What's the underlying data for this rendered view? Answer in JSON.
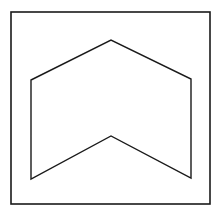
{
  "diagram": {
    "stroke_color": "#1a1a1a",
    "background": "#ffffff",
    "frame": {
      "x": 11,
      "y": 12,
      "width": 199,
      "height": 192,
      "stroke_width": 1.6
    },
    "chevron_shape": {
      "description": "Upward-pointing chevron (arrow-like hexagon)",
      "stroke_width": 1.4,
      "points": [
        [
          31,
          80
        ],
        [
          111,
          40
        ],
        [
          191,
          79
        ],
        [
          191,
          178
        ],
        [
          111,
          136
        ],
        [
          31,
          179
        ]
      ]
    }
  }
}
